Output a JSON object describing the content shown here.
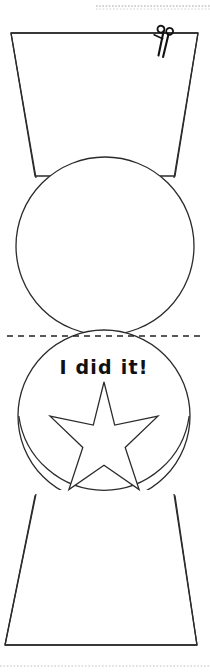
{
  "page": {
    "width": 210,
    "height": 672,
    "background_color": "#ffffff"
  },
  "colors": {
    "outline": "#2b2b2b",
    "ink": "#111111",
    "guide_dot": "#c9c9c9",
    "fold_dash": "#222222",
    "paper": "#ffffff"
  },
  "guides": {
    "top_dotted_rule": {
      "name": "top-dotted-guide",
      "y": 6,
      "x_start": 96,
      "x_end": 210,
      "style": "dotted",
      "color": "#c2c2c2"
    },
    "bottom_dotted_rule": {
      "name": "bottom-dotted-guide",
      "y": 666,
      "x_start": 0,
      "x_end": 210,
      "style": "dotted",
      "color": "#d5d5d5"
    },
    "fold_line": {
      "name": "fold-dashed-line",
      "label": "fold line",
      "y": 336,
      "x_start": 7,
      "x_end": 203,
      "style": "dashed",
      "dash": "6 5",
      "color": "#222222"
    }
  },
  "shapes": {
    "top_trapezoid": {
      "name": "top-trapezoid",
      "points": "11,33 198,33 175,176 35,176",
      "note": "wide at top, narrow at bottom"
    },
    "bottom_trapezoid": {
      "name": "bottom-trapezoid",
      "points": "35,496 175,496 197,645 5,645",
      "note": "narrow at top, wide at bottom"
    },
    "top_circle": {
      "name": "top-circle",
      "cx": 105,
      "cy": 246,
      "r": 89
    },
    "bottom_circle": {
      "name": "bottom-circle",
      "cx": 104,
      "cy": 416,
      "r": 86
    },
    "star": {
      "name": "star-outline",
      "cx": 104,
      "cy": 444,
      "outer_r": 62,
      "inner_r": 26,
      "points": 5
    }
  },
  "scissors": {
    "name": "scissors-icon",
    "label": "cut here",
    "x": 160,
    "y": 34,
    "rotation": -20
  },
  "award": {
    "message": "I did it!",
    "text_x": 104,
    "text_y": 368
  }
}
